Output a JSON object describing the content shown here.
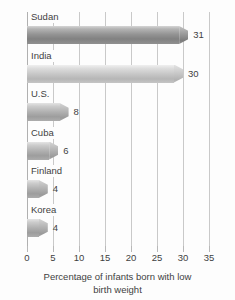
{
  "chart_data": {
    "type": "bar",
    "orientation": "horizontal",
    "title": "",
    "xlabel": "Percentage of infants born with low birth weight",
    "ylabel": "",
    "xlim": [
      0,
      35
    ],
    "xticks": [
      0,
      5,
      10,
      15,
      20,
      25,
      30,
      35
    ],
    "grid": true,
    "legend": false,
    "categories": [
      "Sudan",
      "India",
      "U.S.",
      "Cuba",
      "Finland",
      "Korea"
    ],
    "values": [
      31,
      30,
      8,
      6,
      4,
      4
    ],
    "value_labels": [
      "31",
      "30",
      "8",
      "6",
      "4",
      "4"
    ],
    "bar_shades": [
      "dark",
      "light",
      "med",
      "med",
      "med",
      "med"
    ],
    "colors": {
      "bar_dark": "#949494",
      "bar_light": "#c6c6c6",
      "bar_medium": "#b0b0b0",
      "gridline": "#c9c9c9",
      "axis": "#b0b0b0",
      "text": "#3f3f3f",
      "background": "#fdfdfd"
    }
  },
  "axis": {
    "tick_labels": [
      "0",
      "5",
      "10",
      "15",
      "20",
      "25",
      "30",
      "35"
    ],
    "title_line1": "Percentage of infants born with low",
    "title_line2": "birth weight"
  }
}
